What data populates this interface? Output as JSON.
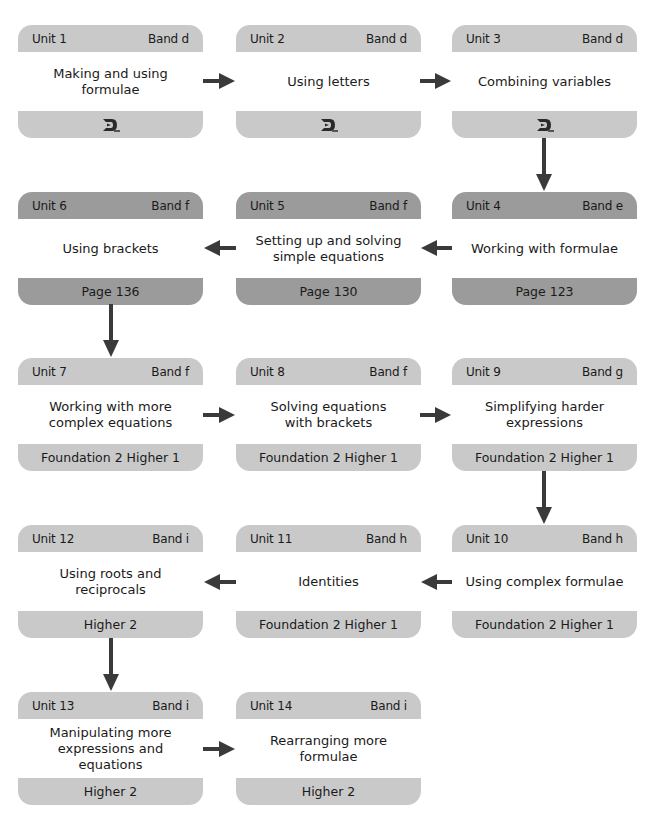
{
  "colors": {
    "header_light": "#c9c9c9",
    "header_dark": "#9b9b9b",
    "body": "#ffffff",
    "arrow": "#3a3a3a"
  },
  "units": [
    {
      "unit": "Unit 1",
      "band": "Band d",
      "title": "Making and using\nformulae",
      "footer": "",
      "footer_icon": "dl-logo-icon"
    },
    {
      "unit": "Unit 2",
      "band": "Band d",
      "title": "Using letters",
      "footer": "",
      "footer_icon": "dl-logo-icon"
    },
    {
      "unit": "Unit 3",
      "band": "Band d",
      "title": "Combining variables",
      "footer": "",
      "footer_icon": "dl-logo-icon"
    },
    {
      "unit": "Unit 4",
      "band": "Band e",
      "title": "Working with formulae",
      "footer": "Page 123"
    },
    {
      "unit": "Unit 5",
      "band": "Band f",
      "title": "Setting up and solving\nsimple equations",
      "footer": "Page 130"
    },
    {
      "unit": "Unit 6",
      "band": "Band f",
      "title": "Using brackets",
      "footer": "Page 136"
    },
    {
      "unit": "Unit 7",
      "band": "Band f",
      "title": "Working with more\ncomplex equations",
      "footer": "Foundation 2 Higher 1"
    },
    {
      "unit": "Unit 8",
      "band": "Band f",
      "title": "Solving equations\nwith brackets",
      "footer": "Foundation 2 Higher 1"
    },
    {
      "unit": "Unit 9",
      "band": "Band g",
      "title": "Simplifying harder\nexpressions",
      "footer": "Foundation 2 Higher 1"
    },
    {
      "unit": "Unit 10",
      "band": "Band h",
      "title": "Using complex formulae",
      "footer": "Foundation 2 Higher 1"
    },
    {
      "unit": "Unit 11",
      "band": "Band h",
      "title": "Identities",
      "footer": "Foundation 2 Higher 1"
    },
    {
      "unit": "Unit 12",
      "band": "Band i",
      "title": "Using roots and\nreciprocals",
      "footer": "Higher 2"
    },
    {
      "unit": "Unit 13",
      "band": "Band i",
      "title": "Manipulating more\nexpressions and\nequations",
      "footer": "Higher 2"
    },
    {
      "unit": "Unit 14",
      "band": "Band i",
      "title": "Rearranging more\nformulae",
      "footer": "Higher 2"
    }
  ],
  "flow": [
    {
      "from": "Unit 1",
      "to": "Unit 2",
      "direction": "right"
    },
    {
      "from": "Unit 2",
      "to": "Unit 3",
      "direction": "right"
    },
    {
      "from": "Unit 3",
      "to": "Unit 4",
      "direction": "down"
    },
    {
      "from": "Unit 4",
      "to": "Unit 5",
      "direction": "left"
    },
    {
      "from": "Unit 5",
      "to": "Unit 6",
      "direction": "left"
    },
    {
      "from": "Unit 6",
      "to": "Unit 7",
      "direction": "down"
    },
    {
      "from": "Unit 7",
      "to": "Unit 8",
      "direction": "right"
    },
    {
      "from": "Unit 8",
      "to": "Unit 9",
      "direction": "right"
    },
    {
      "from": "Unit 9",
      "to": "Unit 10",
      "direction": "down"
    },
    {
      "from": "Unit 10",
      "to": "Unit 11",
      "direction": "left"
    },
    {
      "from": "Unit 11",
      "to": "Unit 12",
      "direction": "left"
    },
    {
      "from": "Unit 12",
      "to": "Unit 13",
      "direction": "down"
    },
    {
      "from": "Unit 13",
      "to": "Unit 14",
      "direction": "right"
    }
  ]
}
